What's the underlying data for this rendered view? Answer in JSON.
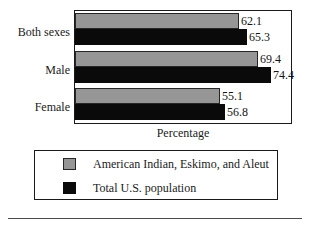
{
  "chart_data": {
    "type": "bar",
    "orientation": "horizontal",
    "title": "",
    "subtitle": "",
    "xlabel": "Percentage",
    "ylabel": "",
    "categories": [
      "Both sexes",
      "Male",
      "Female"
    ],
    "series": [
      {
        "name": "American Indian, Eskimo, and Aleut",
        "color": "#969696",
        "values": [
          62.1,
          69.4,
          55.1
        ],
        "labels": [
          "62.1",
          "69.4",
          "55.1"
        ]
      },
      {
        "name": "Total U.S. population",
        "color": "#0a0a0a",
        "values": [
          65.3,
          74.4,
          56.8
        ],
        "labels": [
          "65.3",
          "74.4",
          "56.8"
        ]
      }
    ],
    "xlim": [
      0,
      82
    ],
    "grid": false,
    "legend_position": "bottom",
    "value_labels_shown": true,
    "tick_labels": {
      "x": [],
      "y": [
        "Both sexes",
        "Male",
        "Female"
      ]
    }
  },
  "axis": {
    "title": "Percentage"
  },
  "legend": {
    "entries": [
      {
        "label": "American Indian, Eskimo, and Aleut",
        "swatch": "series-0"
      },
      {
        "label": "Total U.S. population",
        "swatch": "series-1"
      }
    ]
  },
  "colors": {
    "series_0": "#969696",
    "series_1": "#0a0a0a",
    "frame": "#1a1a1a",
    "background": "#ffffff",
    "rule": "#4d4d4d"
  }
}
